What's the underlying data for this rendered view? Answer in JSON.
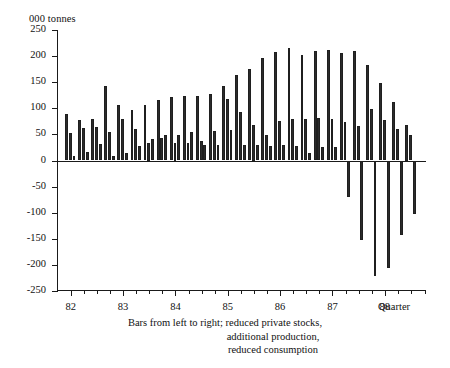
{
  "chart_data": {
    "type": "bar",
    "title": "",
    "subtitle": "",
    "ylabel": "000 tonnes",
    "xlabel": "Quarter",
    "ylim": [
      -250,
      250
    ],
    "ytick_labels": [
      "250",
      "200",
      "150",
      "100",
      "50",
      "0",
      "-50",
      "-100",
      "-150",
      "-200",
      "-250"
    ],
    "ytick_values": [
      250,
      200,
      150,
      100,
      50,
      0,
      -50,
      -100,
      -150,
      -200,
      -250
    ],
    "xtick_labels": [
      "82",
      "83",
      "84",
      "85",
      "86",
      "87",
      "88"
    ],
    "xtick_values": [
      1982,
      1983,
      1984,
      1985,
      1986,
      1987,
      1988
    ],
    "grid": false,
    "legend_position": "none",
    "annotations": [
      "Bars from left to right; reduced private stocks,",
      "additional production,",
      "reduced consumption"
    ],
    "categories": [
      "82Q1",
      "82Q2",
      "82Q3",
      "82Q4",
      "83Q1",
      "83Q2",
      "83Q3",
      "83Q4",
      "84Q1",
      "84Q2",
      "84Q3",
      "84Q4",
      "85Q1",
      "85Q2",
      "85Q3",
      "85Q4",
      "86Q1",
      "86Q2",
      "86Q3",
      "86Q4",
      "87Q1",
      "87Q2",
      "87Q3",
      "87Q4",
      "88Q1",
      "88Q2",
      "88Q3"
    ],
    "series": [
      {
        "name": "reduced private stocks",
        "values": [
          90,
          78,
          80,
          142,
          107,
          97,
          107,
          116,
          122,
          123,
          124,
          128,
          143,
          163,
          175,
          196,
          207,
          215,
          203,
          209,
          212,
          205,
          210,
          183,
          148,
          113,
          68
        ]
      },
      {
        "name": "additional production",
        "values": [
          52,
          63,
          65,
          54,
          80,
          60,
          34,
          44,
          34,
          33,
          38,
          56,
          117,
          92,
          68,
          49,
          75,
          79,
          80,
          81,
          80,
          74,
          66,
          98,
          78,
          60,
          48
        ]
      },
      {
        "name": "reduced consumption",
        "values": [
          8,
          17,
          32,
          8,
          15,
          27,
          42,
          48,
          49,
          55,
          30,
          30,
          59,
          30,
          29,
          28,
          30,
          28,
          14,
          25,
          26,
          -70,
          -152,
          -221,
          -206,
          -142,
          -103
        ]
      }
    ]
  }
}
